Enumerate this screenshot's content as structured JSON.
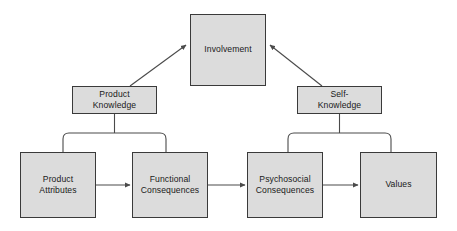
{
  "diagram": {
    "type": "means-end chain / involvement hierarchy",
    "background_color": "#ffffff",
    "node_fill_color": "#dcdcdc",
    "node_border_color": "#3a3a3a",
    "connector_color": "#4a4a4a",
    "text_color": "#1a1a1a",
    "nodes": {
      "involvement": {
        "label": "Involvement"
      },
      "product_knowledge": {
        "label": "Product\nKnowledge"
      },
      "self_knowledge": {
        "label": "Self-\nKnowledge"
      },
      "product_attributes": {
        "label": "Product\nAttributes"
      },
      "functional_consequences": {
        "label": "Functional\nConsequences"
      },
      "psychosocial_consequences": {
        "label": "Psychosocial\nConsequences"
      },
      "values": {
        "label": "Values"
      }
    },
    "connectors": [
      {
        "from": "product_knowledge",
        "to": "involvement",
        "style": "diagonal-arrow"
      },
      {
        "from": "self_knowledge",
        "to": "involvement",
        "style": "diagonal-arrow"
      },
      {
        "from": "product_knowledge",
        "to": "product_attributes",
        "style": "bracket"
      },
      {
        "from": "product_knowledge",
        "to": "functional_consequences",
        "style": "bracket"
      },
      {
        "from": "self_knowledge",
        "to": "psychosocial_consequences",
        "style": "bracket"
      },
      {
        "from": "self_knowledge",
        "to": "values",
        "style": "bracket"
      },
      {
        "from": "product_attributes",
        "to": "functional_consequences",
        "style": "horizontal-arrow"
      },
      {
        "from": "functional_consequences",
        "to": "psychosocial_consequences",
        "style": "horizontal-arrow"
      },
      {
        "from": "psychosocial_consequences",
        "to": "values",
        "style": "horizontal-arrow"
      }
    ]
  }
}
